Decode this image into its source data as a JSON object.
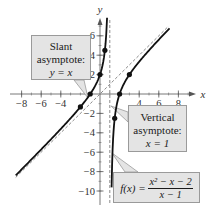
{
  "chart_data": {
    "type": "line",
    "title": "",
    "xlabel": "x",
    "ylabel": "y",
    "xlim": [
      -9,
      9.5
    ],
    "ylim": [
      -11,
      7.5
    ],
    "grid": false,
    "x_ticks": [
      -8,
      -6,
      -4,
      4,
      6,
      8
    ],
    "x_tick_labels": [
      "−8",
      "−6",
      "−4",
      "4",
      "6",
      "8"
    ],
    "y_ticks": [
      6,
      4,
      2,
      -2,
      -4,
      -6,
      -8,
      -10
    ],
    "y_tick_labels": [
      "6",
      "4",
      "2",
      "−2",
      "−4",
      "−6",
      "−8",
      "−10"
    ],
    "function": "f(x) = (x^2 - x - 2)/(x - 1)",
    "series": [
      {
        "name": "f(x) left branch",
        "style": "solid",
        "x": [
          -8.6,
          -6,
          -4,
          -2,
          -1,
          0,
          0.5,
          0.7
        ],
        "y": [
          -8.81,
          -6.29,
          -4.4,
          -1.33,
          0,
          2,
          4.5,
          7.37
        ]
      },
      {
        "name": "f(x) right branch",
        "style": "solid",
        "x": [
          1.2,
          1.5,
          2,
          3,
          4,
          5,
          6,
          7.1
        ],
        "y": [
          -8.8,
          -2.5,
          0,
          2,
          3.33,
          4.5,
          5.6,
          6.77
        ]
      },
      {
        "name": "Slant asymptote y = x",
        "style": "dashed",
        "x": [
          -8.6,
          7
        ],
        "y": [
          -8.6,
          7
        ]
      },
      {
        "name": "Vertical asymptote x = 1",
        "style": "dashed",
        "x": [
          1,
          1
        ],
        "y": [
          -11,
          7.3
        ]
      }
    ],
    "points": [
      {
        "x": -2,
        "y": -1.33
      },
      {
        "x": -1,
        "y": 0
      },
      {
        "x": 0,
        "y": 2
      },
      {
        "x": 0.5,
        "y": 4.5
      },
      {
        "x": 1.5,
        "y": -2.5
      },
      {
        "x": 2,
        "y": 0
      },
      {
        "x": 3,
        "y": 2
      }
    ],
    "annotations": [
      {
        "text": "Slant asymptote: y = x"
      },
      {
        "text": "Vertical asymptote: x = 1"
      },
      {
        "text": "f(x) = (x² − x − 2)/(x − 1)"
      }
    ]
  },
  "labels": {
    "x_axis": "x",
    "y_axis": "y",
    "slant": {
      "line1": "Slant",
      "line2": "asymptote:",
      "line3": "y = x"
    },
    "vertical": {
      "line1": "Vertical",
      "line2": "asymptote:",
      "line3": "x = 1"
    },
    "function": {
      "lhs": "f(x) =",
      "numerator": "x² − x − 2",
      "denominator": "x − 1"
    }
  },
  "colors": {
    "curve": "#111111",
    "asymptote": "#8a8a8a",
    "axis": "#555555",
    "callout_fill": "#e4e4e4",
    "callout_border": "#9a9a9a"
  }
}
